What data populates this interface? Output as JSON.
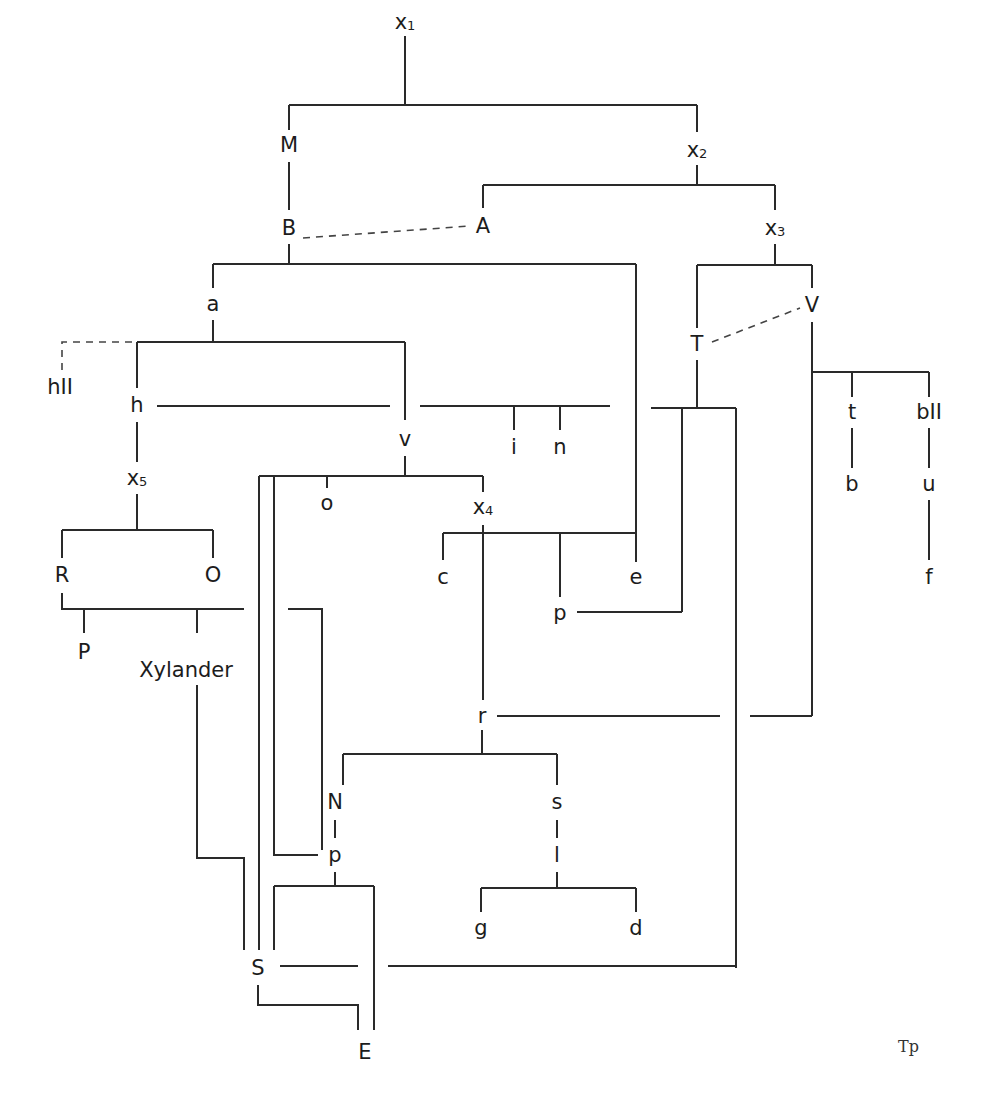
{
  "diagram": {
    "type": "stemma codicum",
    "nodes": [
      {
        "id": "x1",
        "label": "x",
        "sub": "1",
        "x": 405,
        "y": 22
      },
      {
        "id": "M",
        "label": "M",
        "x": 289,
        "y": 145
      },
      {
        "id": "x2",
        "label": "x",
        "sub": "2",
        "x": 697,
        "y": 150
      },
      {
        "id": "B",
        "label": "B",
        "x": 289,
        "y": 228
      },
      {
        "id": "A",
        "label": "A",
        "x": 483,
        "y": 226
      },
      {
        "id": "x3",
        "label": "x",
        "sub": "3",
        "x": 775,
        "y": 228
      },
      {
        "id": "a",
        "label": "a",
        "x": 213,
        "y": 304
      },
      {
        "id": "V",
        "label": "V",
        "x": 812,
        "y": 305
      },
      {
        "id": "T",
        "label": "T",
        "x": 697,
        "y": 344
      },
      {
        "id": "hII",
        "label": "hII",
        "x": 60,
        "y": 387
      },
      {
        "id": "h",
        "label": "h",
        "x": 137,
        "y": 405
      },
      {
        "id": "t",
        "label": "t",
        "x": 852,
        "y": 412
      },
      {
        "id": "bII",
        "label": "bII",
        "x": 929,
        "y": 412
      },
      {
        "id": "v",
        "label": "v",
        "x": 405,
        "y": 439
      },
      {
        "id": "i",
        "label": "i",
        "x": 514,
        "y": 447
      },
      {
        "id": "n",
        "label": "n",
        "x": 560,
        "y": 447
      },
      {
        "id": "o",
        "label": "o",
        "x": 327,
        "y": 503
      },
      {
        "id": "x4",
        "label": "x",
        "sub": "4",
        "x": 483,
        "y": 507
      },
      {
        "id": "b",
        "label": "b",
        "x": 852,
        "y": 484
      },
      {
        "id": "u",
        "label": "u",
        "x": 929,
        "y": 484
      },
      {
        "id": "x5",
        "label": "x",
        "sub": "5",
        "x": 137,
        "y": 478
      },
      {
        "id": "R",
        "label": "R",
        "x": 62,
        "y": 575
      },
      {
        "id": "O",
        "label": "O",
        "x": 213,
        "y": 575
      },
      {
        "id": "c",
        "label": "c",
        "x": 443,
        "y": 577
      },
      {
        "id": "e",
        "label": "e",
        "x": 636,
        "y": 577
      },
      {
        "id": "f",
        "label": "f",
        "x": 929,
        "y": 577
      },
      {
        "id": "p1",
        "label": "p",
        "x": 560,
        "y": 613
      },
      {
        "id": "P",
        "label": "P",
        "x": 84,
        "y": 652
      },
      {
        "id": "Xylander",
        "label": "Xylander",
        "x": 186,
        "y": 670
      },
      {
        "id": "r",
        "label": "r",
        "x": 482,
        "y": 716
      },
      {
        "id": "N",
        "label": "N",
        "x": 335,
        "y": 802
      },
      {
        "id": "s",
        "label": "s",
        "x": 557,
        "y": 802
      },
      {
        "id": "p2",
        "label": "p",
        "x": 335,
        "y": 855
      },
      {
        "id": "l",
        "label": "l",
        "x": 557,
        "y": 855
      },
      {
        "id": "g",
        "label": "g",
        "x": 481,
        "y": 928
      },
      {
        "id": "d",
        "label": "d",
        "x": 636,
        "y": 928
      },
      {
        "id": "S",
        "label": "S",
        "x": 258,
        "y": 968
      },
      {
        "id": "E",
        "label": "E",
        "x": 365,
        "y": 1052
      }
    ],
    "signature": "Tp",
    "colors": {
      "line": "#2a2a2a",
      "text": "#1c1c1c",
      "background": "#ffffff"
    }
  }
}
